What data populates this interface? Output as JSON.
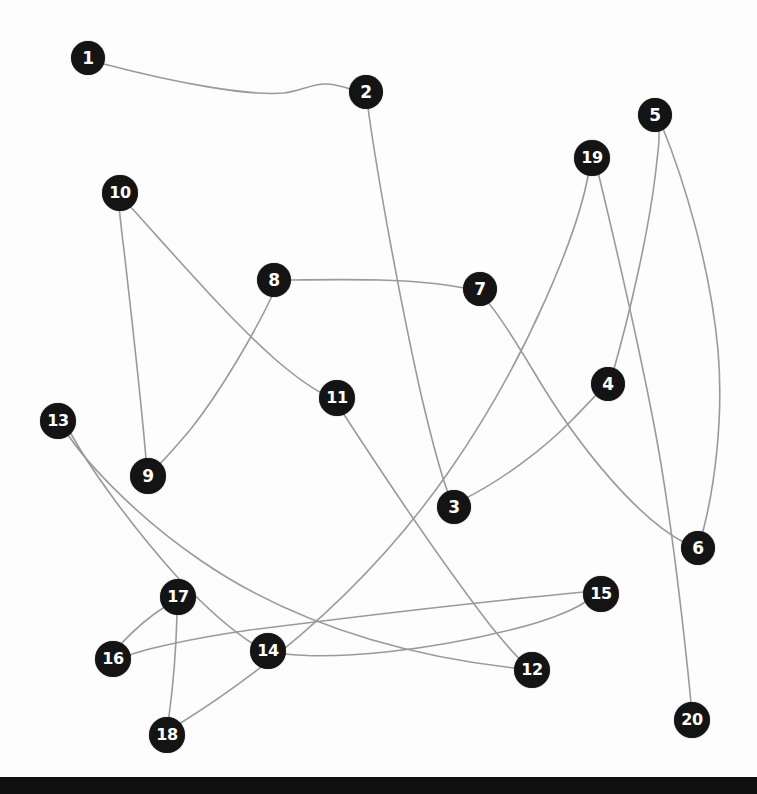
{
  "scene": {
    "title": "Connect the dots puzzle",
    "width": 757,
    "height": 794,
    "background_color": "#fdfdfd",
    "bottom_bar_color": "#101010",
    "bottom_bar_top": 777,
    "line_color": "#9a9a9a",
    "dot_fill_color": "#141414",
    "dot_text_color": "#ffffff"
  },
  "dots": [
    {
      "label": "1",
      "x": 88,
      "y": 58,
      "r": 17,
      "font_size": 17
    },
    {
      "label": "2",
      "x": 366,
      "y": 92,
      "r": 17,
      "font_size": 17
    },
    {
      "label": "3",
      "x": 454,
      "y": 507,
      "r": 17,
      "font_size": 17
    },
    {
      "label": "4",
      "x": 608,
      "y": 384,
      "r": 17,
      "font_size": 17
    },
    {
      "label": "5",
      "x": 655,
      "y": 115,
      "r": 17,
      "font_size": 17
    },
    {
      "label": "6",
      "x": 698,
      "y": 548,
      "r": 17,
      "font_size": 17
    },
    {
      "label": "7",
      "x": 480,
      "y": 289,
      "r": 17,
      "font_size": 17
    },
    {
      "label": "8",
      "x": 274,
      "y": 280,
      "r": 17,
      "font_size": 17
    },
    {
      "label": "9",
      "x": 148,
      "y": 476,
      "r": 18,
      "font_size": 17
    },
    {
      "label": "10",
      "x": 120,
      "y": 193,
      "r": 18,
      "font_size": 16
    },
    {
      "label": "11",
      "x": 337,
      "y": 398,
      "r": 18,
      "font_size": 16
    },
    {
      "label": "12",
      "x": 532,
      "y": 670,
      "r": 18,
      "font_size": 16
    },
    {
      "label": "13",
      "x": 58,
      "y": 421,
      "r": 18,
      "font_size": 16
    },
    {
      "label": "14",
      "x": 268,
      "y": 651,
      "r": 18,
      "font_size": 16
    },
    {
      "label": "15",
      "x": 601,
      "y": 594,
      "r": 18,
      "font_size": 16
    },
    {
      "label": "16",
      "x": 113,
      "y": 659,
      "r": 18,
      "font_size": 16
    },
    {
      "label": "17",
      "x": 178,
      "y": 597,
      "r": 18,
      "font_size": 16
    },
    {
      "label": "18",
      "x": 167,
      "y": 735,
      "r": 18,
      "font_size": 16
    },
    {
      "label": "19",
      "x": 592,
      "y": 158,
      "r": 18,
      "font_size": 16
    },
    {
      "label": "20",
      "x": 692,
      "y": 720,
      "r": 18,
      "font_size": 16
    }
  ],
  "edges": [
    {
      "from": "1",
      "to": "2",
      "path": "M 104 64 C 180 84, 250 96, 284 93 C 300 91, 312 84, 325 84 C 340 84, 352 90, 360 92"
    },
    {
      "from": "2",
      "to": "3",
      "path": "M 368 108 C 378 180, 400 300, 420 390 C 434 450, 446 490, 452 502"
    },
    {
      "from": "3",
      "to": "4",
      "path": "M 460 501 C 500 482, 545 448, 572 420 C 588 404, 598 392, 604 388"
    },
    {
      "from": "4",
      "to": "5",
      "path": "M 612 376 C 628 320, 650 230, 657 160 C 660 138, 659 126, 657 122"
    },
    {
      "from": "5",
      "to": "6",
      "path": "M 662 126 C 684 180, 710 265, 718 350 C 724 420, 714 490, 702 535"
    },
    {
      "from": "6",
      "to": "7",
      "path": "M 685 543 C 640 520, 580 450, 534 372 C 510 332, 492 305, 483 297"
    },
    {
      "from": "7",
      "to": "8",
      "path": "M 464 288 C 444 284, 420 281, 380 280 C 340 279, 305 280, 290 280"
    },
    {
      "from": "8",
      "to": "9",
      "path": "M 272 296 C 256 330, 222 390, 190 430 C 168 456, 154 470, 150 473"
    },
    {
      "from": "9",
      "to": "10",
      "path": "M 146 459 C 142 410, 132 320, 124 250 C 120 220, 119 202, 119 210"
    },
    {
      "from": "10",
      "to": "11",
      "path": "M 128 204 C 170 250, 230 320, 276 360 C 305 385, 324 395, 330 397"
    },
    {
      "from": "11",
      "to": "12",
      "path": "M 343 413 C 380 470, 440 560, 490 625 C 512 652, 525 665, 529 667"
    },
    {
      "from": "12",
      "to": "13",
      "path": "M 515 668 C 440 660, 310 636, 200 560 C 130 512, 80 455, 65 430"
    },
    {
      "from": "13",
      "to": "14",
      "path": "M 70 432 C 88 465, 130 525, 180 580 C 225 628, 256 646, 263 650"
    },
    {
      "from": "14",
      "to": "15",
      "path": "M 285 654 C 340 660, 430 650, 510 630 C 560 618, 585 604, 589 598"
    },
    {
      "from": "15",
      "to": "16",
      "path": "M 584 592 C 500 600, 360 616, 250 630 C 180 640, 135 652, 128 656"
    },
    {
      "from": "16",
      "to": "17",
      "path": "M 120 645 C 132 632, 150 616, 166 606 C 174 601, 178 598, 178 596"
    },
    {
      "from": "17",
      "to": "18",
      "path": "M 177 615 C 176 650, 172 694, 169 716 C 168 726, 168 730, 168 733"
    },
    {
      "from": "18",
      "to": "19",
      "path": "M 176 726 C 250 680, 360 600, 450 470 C 530 355, 578 230, 588 176"
    },
    {
      "from": "19",
      "to": "20",
      "path": "M 598 172 C 612 230, 636 330, 655 430 C 672 520, 686 650, 691 703"
    }
  ]
}
